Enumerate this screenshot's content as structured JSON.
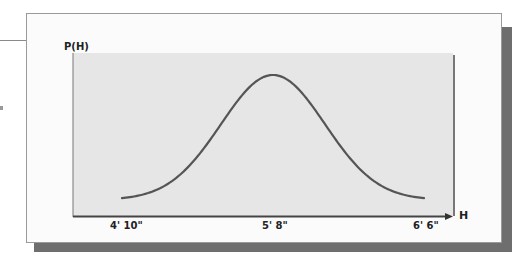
{
  "chart_data": {
    "type": "line",
    "title": "",
    "ylabel": "P(H)",
    "xlabel": "H",
    "x_tick_labels": [
      "4' 10\"",
      "5' 8\"",
      "6' 6\""
    ],
    "x_inches": [
      58,
      60,
      62,
      64,
      66,
      68,
      70,
      72,
      74,
      76,
      78
    ],
    "series": [
      {
        "name": "normal distribution of height",
        "description": "bell curve centered at 5' 8\"",
        "values": [
          0.02,
          0.06,
          0.16,
          0.37,
          0.71,
          1.0,
          0.71,
          0.37,
          0.16,
          0.06,
          0.02
        ]
      }
    ],
    "grid": false,
    "legend": false,
    "ylim": [
      0,
      1.1
    ]
  },
  "colors": {
    "plot_background": "#e6e6e6",
    "curve": "#555555",
    "frame_shadow": "#6e6e6e"
  }
}
